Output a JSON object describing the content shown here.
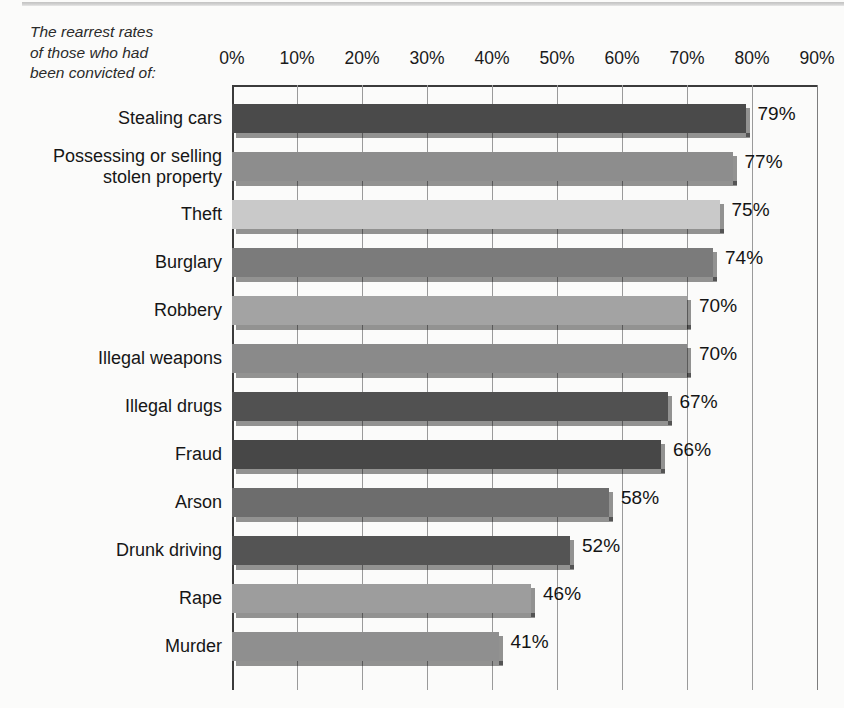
{
  "caption": {
    "lines": [
      "The rearrest rates",
      "of those who had",
      "been convicted of:"
    ]
  },
  "axis": {
    "ticks": [
      "0%",
      "10%",
      "20%",
      "30%",
      "40%",
      "50%",
      "60%",
      "70%",
      "80%",
      "90%"
    ],
    "min": 0,
    "max": 90
  },
  "chart_data": {
    "type": "bar",
    "orientation": "horizontal",
    "xlabel": "",
    "ylabel": "",
    "xlim": [
      0,
      90
    ],
    "xtick_labels": [
      "0%",
      "10%",
      "20%",
      "30%",
      "40%",
      "50%",
      "60%",
      "70%",
      "80%",
      "90%"
    ],
    "grid": true,
    "legend": "none",
    "units": "percent",
    "categories": [
      "Stealing cars",
      "Possessing or selling\nstolen property",
      "Theft",
      "Burglary",
      "Robbery",
      "Illegal weapons",
      "Illegal drugs",
      "Fraud",
      "Arson",
      "Drunk driving",
      "Rape",
      "Murder"
    ],
    "values": [
      79,
      77,
      75,
      74,
      70,
      70,
      67,
      66,
      58,
      52,
      46,
      41
    ],
    "value_labels": [
      "79%",
      "77%",
      "75%",
      "74%",
      "70%",
      "70%",
      "67%",
      "66%",
      "58%",
      "52%",
      "46%",
      "41%"
    ],
    "bar_colors": [
      "#4a4a4a",
      "#8d8d8d",
      "#c9c9c9",
      "#7b7b7b",
      "#a3a3a3",
      "#8a8a8a",
      "#515151",
      "#474747",
      "#6d6d6d",
      "#545454",
      "#9d9d9d",
      "#8f8f8f"
    ]
  },
  "colors": {
    "background": "#fbfbfa",
    "axis": "#3b3b3b",
    "gridline": "#9a9a9a",
    "text": "#1c1c1c"
  }
}
